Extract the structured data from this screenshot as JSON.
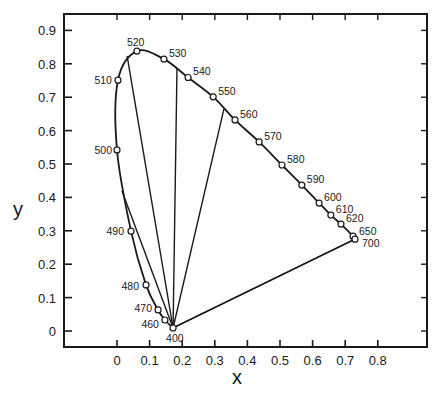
{
  "chart_data": {
    "type": "scatter",
    "title": "",
    "xlabel": "x",
    "ylabel": "y",
    "xlim": [
      -0.16,
      0.95
    ],
    "ylim": [
      -0.05,
      0.95
    ],
    "grid": false,
    "x_ticks": [
      "0",
      "0.1",
      "0.2",
      "0.3",
      "0.4",
      "0.5",
      "0.6",
      "0.7",
      "0.8"
    ],
    "y_ticks": [
      "0",
      "0.1",
      "0.2",
      "0.3",
      "0.4",
      "0.5",
      "0.6",
      "0.7",
      "0.8",
      "0.9"
    ],
    "spectral_locus": {
      "name": "Spectral locus (wavelength, nm)",
      "points": [
        {
          "label": "400",
          "x": 0.172,
          "y": 0.009
        },
        {
          "label": "460",
          "x": 0.147,
          "y": 0.033
        },
        {
          "label": "470",
          "x": 0.126,
          "y": 0.063
        },
        {
          "label": "480",
          "x": 0.089,
          "y": 0.138
        },
        {
          "label": "490",
          "x": 0.043,
          "y": 0.299
        },
        {
          "label": "500",
          "x": 0.0,
          "y": 0.542
        },
        {
          "label": "510",
          "x": 0.003,
          "y": 0.751
        },
        {
          "label": "520",
          "x": 0.061,
          "y": 0.838
        },
        {
          "label": "530",
          "x": 0.144,
          "y": 0.814
        },
        {
          "label": "540",
          "x": 0.218,
          "y": 0.759
        },
        {
          "label": "550",
          "x": 0.295,
          "y": 0.701
        },
        {
          "label": "560",
          "x": 0.362,
          "y": 0.632
        },
        {
          "label": "570",
          "x": 0.436,
          "y": 0.566
        },
        {
          "label": "580",
          "x": 0.506,
          "y": 0.497
        },
        {
          "label": "590",
          "x": 0.567,
          "y": 0.437
        },
        {
          "label": "600",
          "x": 0.62,
          "y": 0.383
        },
        {
          "label": "610",
          "x": 0.656,
          "y": 0.347
        },
        {
          "label": "620",
          "x": 0.687,
          "y": 0.32
        },
        {
          "label": "650",
          "x": 0.724,
          "y": 0.284
        },
        {
          "label": "700",
          "x": 0.73,
          "y": 0.275
        }
      ]
    },
    "lines_from_400": [
      {
        "to_x": 0.015,
        "to_y": 0.42
      },
      {
        "to_x": 0.031,
        "to_y": 0.824
      },
      {
        "to_x": 0.184,
        "to_y": 0.787
      },
      {
        "to_x": 0.328,
        "to_y": 0.665
      },
      {
        "to_x": 0.73,
        "to_y": 0.275
      }
    ]
  }
}
